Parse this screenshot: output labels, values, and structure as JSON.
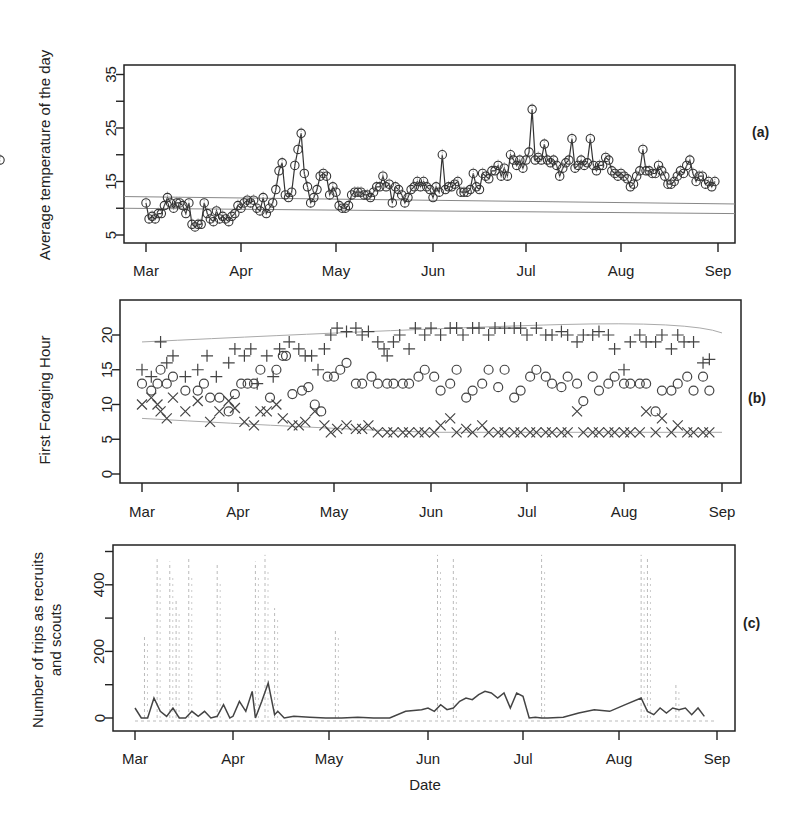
{
  "figure": {
    "xlabel_bottom": "Date",
    "month_ticks": [
      "Mar",
      "Apr",
      "May",
      "Jun",
      "Jul",
      "Aug",
      "Sep"
    ]
  },
  "chart_data": [
    {
      "panel": "(a)",
      "type": "line",
      "ylabel": "Average temperature of the day",
      "xlabel": "",
      "xticks": [
        "Mar",
        "Apr",
        "May",
        "Jun",
        "Jul",
        "Aug",
        "Sep"
      ],
      "yticks": [
        5,
        15,
        25,
        35
      ],
      "ylim": [
        4,
        36
      ],
      "grid": false,
      "reference_lines": [
        10,
        12
      ],
      "series": [
        {
          "name": "Daily average temperature",
          "marker": "circle",
          "x_day_offset": [
            0,
            1,
            2,
            3,
            4,
            5,
            6,
            7,
            8,
            9,
            10,
            11,
            12,
            13,
            14,
            15,
            16,
            17,
            18,
            19,
            20,
            21,
            22,
            23,
            24,
            25,
            26,
            27,
            28,
            29,
            30,
            31,
            32,
            33,
            34,
            35,
            36,
            37,
            38,
            39,
            40,
            41,
            42,
            43,
            44,
            45,
            46,
            47,
            48,
            49,
            50,
            51,
            52,
            53,
            54,
            55,
            56,
            57,
            58,
            59,
            60,
            61,
            62,
            63,
            64,
            65,
            66,
            67,
            68,
            69,
            70,
            71,
            72,
            73,
            74,
            75,
            76,
            77,
            78,
            79,
            80,
            81,
            82,
            83,
            84,
            85,
            86,
            87,
            88,
            89,
            90,
            91,
            92,
            93,
            94,
            95,
            96,
            97,
            98,
            99,
            100,
            101,
            102,
            103,
            104,
            105,
            106,
            107,
            108,
            109,
            110,
            111,
            112,
            113,
            114,
            115,
            116,
            117,
            118,
            119,
            120,
            121,
            122,
            123,
            124,
            125,
            126,
            127,
            128,
            129,
            130,
            131,
            132,
            133,
            134,
            135,
            136,
            137,
            138,
            139,
            140,
            141,
            142,
            143,
            144,
            145,
            146,
            147,
            148,
            149,
            150,
            151,
            152,
            153,
            154,
            155,
            156,
            157,
            158,
            159,
            160,
            161,
            162,
            163,
            164,
            165,
            166,
            167,
            168,
            169,
            170,
            171,
            172,
            173,
            174,
            175,
            176,
            177,
            178,
            179,
            180,
            181,
            182,
            183
          ],
          "values": [
            11,
            8,
            8.5,
            8,
            9,
            9,
            10.5,
            12,
            11,
            10,
            11,
            11,
            10.5,
            9,
            11,
            7,
            6.5,
            7,
            7,
            11,
            9,
            8,
            7.5,
            9.5,
            8,
            8.5,
            8,
            7.5,
            8.5,
            9,
            10.5,
            10,
            11,
            11.5,
            11,
            11.5,
            10,
            9.5,
            12,
            9,
            10,
            11,
            13.5,
            17,
            18.5,
            12.5,
            12,
            13,
            18,
            21,
            24,
            16.5,
            14,
            11,
            12,
            13.5,
            16,
            16.5,
            16,
            12.5,
            14,
            13,
            10.5,
            10,
            10,
            10.5,
            12.5,
            13,
            13,
            13,
            12.5,
            12.5,
            12,
            13,
            14,
            14,
            16,
            14,
            14.5,
            11,
            14,
            13.5,
            12.5,
            11,
            12,
            13.5,
            14,
            15,
            14,
            15,
            14,
            13.5,
            12,
            14,
            13,
            20,
            13.5,
            14,
            14,
            14.5,
            15,
            13,
            13,
            13,
            13.5,
            16.5,
            14,
            13.5,
            16.5,
            16,
            15.5,
            17,
            17,
            18,
            16,
            17.5,
            16,
            20,
            19,
            18,
            19,
            17.5,
            19,
            20.5,
            28.5,
            19,
            19.5,
            19,
            22,
            19,
            18.5,
            19,
            18,
            16,
            17.5,
            18.5,
            19,
            23,
            17.5,
            18,
            19,
            18,
            18.5,
            23,
            18,
            17,
            18,
            18,
            19.5,
            19,
            17,
            16.5,
            16,
            16.5,
            16,
            15.5,
            14,
            14.5,
            16,
            17,
            21,
            17,
            17,
            16.5,
            16.5,
            18,
            17,
            16,
            14.5,
            14.5,
            15,
            16,
            17,
            16.5,
            18,
            19,
            16.5,
            15,
            16,
            16,
            14.5,
            15,
            14,
            15,
            19
          ]
        }
      ]
    },
    {
      "panel": "(b)",
      "type": "scatter",
      "ylabel": "First Foraging Hour",
      "xlabel": "",
      "xticks": [
        "Mar",
        "Apr",
        "May",
        "Jun",
        "Jul",
        "Aug",
        "Sep"
      ],
      "yticks": [
        0,
        5,
        10,
        15,
        20
      ],
      "ylim": [
        -0.5,
        23.5
      ],
      "grid": false,
      "reference_lines": [
        {
          "name": "upper envelope",
          "from": 19,
          "to_peak": 21.5,
          "to_end": 20
        },
        {
          "name": "lower envelope",
          "from": 8,
          "to": 6
        }
      ],
      "series": [
        {
          "name": "Latest (plus)",
          "marker": "plus",
          "x_day_offset": [
            0,
            3,
            6,
            8,
            10,
            14,
            18,
            21,
            24,
            28,
            30,
            33,
            35,
            37,
            40,
            42,
            44,
            47,
            50,
            52,
            54,
            56,
            58,
            60,
            62,
            65,
            68,
            70,
            72,
            75,
            77,
            78,
            80,
            82,
            85,
            87,
            90,
            92,
            95,
            98,
            100,
            102,
            105,
            107,
            110,
            112,
            115,
            118,
            120,
            122,
            125,
            128,
            130,
            133,
            135,
            138,
            140,
            143,
            145,
            148,
            150,
            153,
            155,
            158,
            160,
            163,
            165,
            168,
            170,
            172,
            175,
            178,
            180
          ],
          "values": [
            15,
            14,
            19,
            16,
            17,
            14,
            15,
            17,
            14,
            16,
            18,
            17,
            18,
            13,
            17,
            14,
            18,
            19,
            18,
            17,
            17,
            15,
            18,
            20,
            21,
            20.5,
            21,
            20,
            20.5,
            19,
            18,
            17,
            19,
            20,
            18,
            21,
            20,
            21,
            20,
            21,
            21,
            20,
            21,
            21,
            20,
            21,
            21,
            21,
            21,
            20,
            21,
            20,
            20,
            20.5,
            20,
            19,
            20,
            20,
            20.5,
            20,
            18,
            15,
            19,
            20,
            19,
            19,
            20,
            18,
            20,
            19,
            19,
            16,
            16.5
          ]
        },
        {
          "name": "Mean (circle)",
          "marker": "circle",
          "x_day_offset": [
            0,
            3,
            5,
            6,
            8,
            10,
            14,
            18,
            20,
            22,
            25,
            28,
            30,
            32,
            34,
            36,
            38,
            41,
            43,
            45,
            46,
            48,
            51,
            53,
            55,
            57,
            59,
            61,
            63,
            65,
            68,
            70,
            73,
            75,
            78,
            80,
            83,
            85,
            88,
            90,
            93,
            95,
            98,
            100,
            103,
            105,
            108,
            110,
            113,
            115,
            118,
            120,
            123,
            125,
            128,
            130,
            133,
            135,
            138,
            140,
            143,
            145,
            148,
            150,
            153,
            155,
            158,
            160,
            163,
            165,
            168,
            170,
            173,
            175,
            178,
            180
          ],
          "values": [
            13,
            12,
            13,
            15,
            13,
            14,
            12,
            12,
            13,
            11,
            11,
            9,
            11.5,
            13,
            13,
            13,
            15,
            11,
            15,
            17,
            17,
            11.5,
            12,
            12.5,
            10,
            9,
            14,
            14,
            15,
            16,
            13,
            13,
            14,
            13,
            13,
            13,
            13,
            13,
            14,
            15,
            14,
            12,
            13,
            15,
            11,
            12,
            13,
            15,
            12.5,
            15,
            11,
            12,
            14,
            15,
            14,
            13,
            12.5,
            14,
            13,
            10.5,
            14,
            12,
            13,
            14,
            13,
            13,
            13,
            13,
            9,
            12,
            12,
            13,
            14,
            12,
            14,
            12
          ]
        },
        {
          "name": "Earliest (cross)",
          "marker": "cross",
          "x_day_offset": [
            0,
            3,
            5,
            6,
            8,
            10,
            14,
            18,
            22,
            25,
            28,
            30,
            33,
            36,
            38,
            40,
            43,
            45,
            48,
            50,
            52,
            55,
            58,
            60,
            62,
            65,
            68,
            70,
            72,
            75,
            78,
            80,
            83,
            85,
            88,
            90,
            93,
            95,
            98,
            100,
            103,
            105,
            108,
            110,
            113,
            115,
            118,
            120,
            123,
            125,
            128,
            130,
            133,
            135,
            138,
            140,
            143,
            145,
            148,
            150,
            153,
            155,
            158,
            160,
            163,
            165,
            168,
            170,
            173,
            175,
            178,
            180
          ],
          "values": [
            10,
            11,
            10,
            9,
            8,
            11,
            9,
            10.5,
            7.5,
            9,
            10.5,
            9.5,
            7.5,
            7,
            9,
            9,
            10,
            8,
            7,
            7,
            7.5,
            9,
            7,
            6,
            6.5,
            7,
            6.5,
            6.5,
            7,
            6,
            6,
            6,
            6,
            6,
            6,
            6,
            6,
            7,
            8,
            6,
            6.5,
            6,
            7,
            6,
            6,
            6,
            6,
            6,
            6,
            6,
            6,
            6,
            6,
            6,
            9,
            6,
            6,
            6,
            6,
            6,
            6,
            6,
            6,
            9,
            6,
            8,
            6,
            7,
            6,
            6,
            6,
            6
          ]
        }
      ]
    },
    {
      "panel": "(c)",
      "type": "line",
      "ylabel": "Number of trips as recruits and scouts",
      "xlabel": "Date",
      "xticks": [
        "Mar",
        "Apr",
        "May",
        "Jun",
        "Jul",
        "Aug",
        "Sep"
      ],
      "yticks": [
        0,
        200,
        400
      ],
      "ylim": [
        -20,
        520
      ],
      "grid": false,
      "series": [
        {
          "name": "Recruit trips (solid)",
          "style": "solid",
          "x_day_offset": [
            0,
            2,
            4,
            6,
            8,
            10,
            12,
            14,
            16,
            18,
            20,
            22,
            24,
            26,
            28,
            30,
            31,
            33,
            35,
            37,
            38,
            40,
            42,
            44,
            45,
            47,
            50,
            55,
            60,
            65,
            70,
            75,
            80,
            85,
            90,
            92,
            94,
            96,
            98,
            100,
            102,
            104,
            106,
            108,
            110,
            112,
            114,
            116,
            118,
            120,
            122,
            124,
            126,
            128,
            130,
            135,
            140,
            145,
            150,
            155,
            160,
            162,
            164,
            166,
            168,
            170,
            172,
            174,
            176,
            178,
            180
          ],
          "values": [
            30,
            0,
            0,
            60,
            20,
            5,
            30,
            0,
            0,
            20,
            5,
            20,
            0,
            5,
            40,
            0,
            5,
            50,
            20,
            80,
            0,
            50,
            105,
            10,
            20,
            0,
            5,
            2,
            0,
            0,
            2,
            0,
            0,
            20,
            25,
            30,
            20,
            40,
            25,
            30,
            50,
            60,
            55,
            70,
            80,
            75,
            60,
            75,
            30,
            75,
            65,
            0,
            2,
            0,
            0,
            2,
            15,
            25,
            20,
            40,
            60,
            20,
            10,
            30,
            15,
            30,
            25,
            30,
            10,
            30,
            5
          ]
        },
        {
          "name": "Scout trips (dashed)",
          "style": "dashed",
          "spikes_day_offset": [
            3,
            7,
            11,
            13,
            17,
            26,
            38,
            41,
            44,
            63,
            95,
            100,
            128,
            160,
            162,
            171
          ],
          "spike_values": [
            250,
            480,
            470,
            360,
            480,
            460,
            470,
            490,
            330,
            270,
            490,
            480,
            490,
            490,
            480,
            100
          ]
        }
      ]
    }
  ]
}
